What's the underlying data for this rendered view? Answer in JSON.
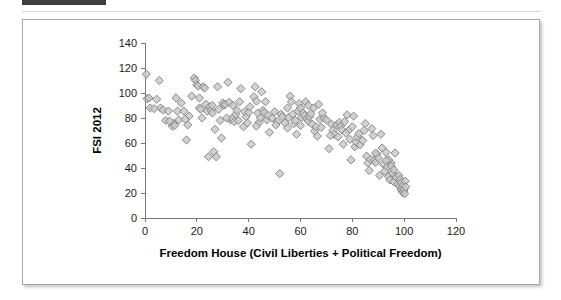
{
  "decor": {
    "top_bar_color": "#3d3d3d",
    "top_bar_track_color": "#e8e8e8",
    "rule_color": "#d6d6d6"
  },
  "figure": {
    "border_color": "#a8a8a8",
    "background_color": "#ffffff"
  },
  "chart_data": {
    "type": "scatter",
    "title": "",
    "subtitle": "",
    "xlabel": "Freedom House (Civil Liberties + Political Freedom)",
    "ylabel": "FSI 2012",
    "xlim": [
      0,
      120
    ],
    "ylim": [
      0,
      140
    ],
    "xticks": [
      0,
      20,
      40,
      60,
      80,
      100,
      120
    ],
    "yticks": [
      0,
      20,
      40,
      60,
      80,
      100,
      120,
      140
    ],
    "grid": false,
    "legend": null,
    "legend_position": "none",
    "marker": {
      "shape": "diamond",
      "size_px": 7,
      "fill": "#c9c9c9",
      "edge": "#7f7f7f"
    },
    "annotations": [],
    "series": [
      {
        "name": "Countries",
        "points": [
          [
            0.5,
            115.0
          ],
          [
            0.8,
            95.5
          ],
          [
            1.5,
            96.0
          ],
          [
            2.0,
            88.0
          ],
          [
            4.5,
            95.0
          ],
          [
            5.5,
            110.0
          ],
          [
            6.0,
            88.0
          ],
          [
            7.0,
            86.5
          ],
          [
            8.0,
            78.0
          ],
          [
            9.0,
            85.5
          ],
          [
            10.5,
            73.5
          ],
          [
            11.0,
            75.5
          ],
          [
            11.5,
            74.0
          ],
          [
            12.0,
            96.0
          ],
          [
            12.5,
            85.5
          ],
          [
            13.0,
            78.5
          ],
          [
            14.0,
            92.0
          ],
          [
            15.0,
            85.5
          ],
          [
            16.0,
            62.5
          ],
          [
            16.5,
            74.5
          ],
          [
            17.0,
            81.5
          ],
          [
            18.0,
            97.5
          ],
          [
            19.0,
            112.0
          ],
          [
            19.5,
            110.0
          ],
          [
            20.0,
            106.5
          ],
          [
            20.5,
            105.5
          ],
          [
            21.0,
            88.0
          ],
          [
            21.5,
            87.0
          ],
          [
            22.0,
            80.0
          ],
          [
            22.5,
            105.0
          ],
          [
            23.0,
            104.0
          ],
          [
            23.5,
            91.0
          ],
          [
            24.0,
            85.5
          ],
          [
            24.5,
            49.0
          ],
          [
            25.0,
            89.0
          ],
          [
            25.5,
            86.0
          ],
          [
            26.0,
            84.0
          ],
          [
            26.5,
            53.0
          ],
          [
            27.0,
            71.0
          ],
          [
            27.5,
            49.0
          ],
          [
            28.0,
            105.0
          ],
          [
            28.5,
            87.0
          ],
          [
            29.0,
            78.0
          ],
          [
            29.5,
            64.0
          ],
          [
            30.0,
            92.0
          ],
          [
            30.5,
            90.5
          ],
          [
            31.0,
            91.0
          ],
          [
            32.0,
            108.5
          ],
          [
            32.5,
            92.5
          ],
          [
            33.0,
            78.5
          ],
          [
            33.5,
            79.5
          ],
          [
            34.0,
            90.0
          ],
          [
            34.5,
            77.0
          ],
          [
            35.0,
            83.0
          ],
          [
            35.5,
            86.0
          ],
          [
            36.0,
            78.0
          ],
          [
            37.0,
            103.5
          ],
          [
            38.0,
            73.0
          ],
          [
            38.5,
            85.0
          ],
          [
            39.0,
            81.0
          ],
          [
            40.0,
            84.5
          ],
          [
            40.5,
            89.0
          ],
          [
            41.0,
            59.0
          ],
          [
            42.0,
            97.0
          ],
          [
            42.5,
            105.0
          ],
          [
            43.0,
            93.5
          ],
          [
            43.5,
            84.0
          ],
          [
            44.0,
            76.5
          ],
          [
            44.5,
            80.0
          ],
          [
            45.0,
            101.0
          ],
          [
            45.5,
            86.0
          ],
          [
            46.0,
            84.5
          ],
          [
            47.0,
            78.5
          ],
          [
            47.5,
            82.0
          ],
          [
            48.0,
            68.5
          ],
          [
            49.0,
            80.0
          ],
          [
            50.0,
            85.0
          ],
          [
            51.0,
            77.0
          ],
          [
            52.0,
            35.5
          ],
          [
            52.5,
            83.0
          ],
          [
            53.0,
            81.0
          ],
          [
            54.0,
            76.0
          ],
          [
            55.0,
            88.0
          ],
          [
            55.5,
            80.5
          ],
          [
            56.0,
            97.5
          ],
          [
            56.5,
            93.0
          ],
          [
            57.0,
            83.0
          ],
          [
            57.5,
            75.5
          ],
          [
            58.0,
            78.0
          ],
          [
            58.5,
            67.0
          ],
          [
            59.0,
            85.5
          ],
          [
            59.5,
            91.5
          ],
          [
            60.0,
            88.0
          ],
          [
            60.5,
            80.5
          ],
          [
            61.0,
            84.0
          ],
          [
            61.5,
            82.0
          ],
          [
            62.0,
            93.0
          ],
          [
            62.5,
            79.5
          ],
          [
            63.0,
            77.5
          ],
          [
            63.5,
            81.0
          ],
          [
            64.0,
            83.5
          ],
          [
            64.5,
            75.0
          ],
          [
            65.0,
            88.0
          ],
          [
            65.5,
            69.5
          ],
          [
            66.0,
            73.0
          ],
          [
            66.5,
            65.5
          ],
          [
            67.0,
            91.0
          ],
          [
            67.5,
            79.0
          ],
          [
            68.0,
            72.5
          ],
          [
            69.0,
            80.0
          ],
          [
            70.0,
            78.5
          ],
          [
            71.0,
            55.5
          ],
          [
            72.0,
            75.0
          ],
          [
            72.5,
            70.0
          ],
          [
            73.0,
            67.0
          ],
          [
            74.0,
            74.5
          ],
          [
            75.0,
            76.5
          ],
          [
            75.5,
            73.5
          ],
          [
            76.0,
            70.5
          ],
          [
            76.5,
            59.0
          ],
          [
            77.0,
            77.0
          ],
          [
            78.0,
            82.5
          ],
          [
            78.5,
            70.0
          ],
          [
            79.0,
            63.0
          ],
          [
            79.5,
            46.5
          ],
          [
            80.0,
            73.0
          ],
          [
            80.5,
            81.5
          ],
          [
            81.0,
            57.0
          ],
          [
            81.5,
            60.5
          ],
          [
            82.0,
            65.0
          ],
          [
            82.5,
            67.5
          ],
          [
            83.0,
            58.5
          ],
          [
            84.0,
            62.0
          ],
          [
            85.0,
            75.5
          ],
          [
            85.5,
            49.5
          ],
          [
            86.0,
            44.0
          ],
          [
            86.5,
            38.0
          ],
          [
            87.0,
            47.0
          ],
          [
            87.5,
            71.5
          ],
          [
            88.0,
            66.0
          ],
          [
            88.5,
            46.5
          ],
          [
            89.0,
            44.5
          ],
          [
            89.5,
            51.0
          ],
          [
            90.0,
            48.0
          ],
          [
            90.5,
            34.0
          ],
          [
            91.0,
            67.0
          ],
          [
            91.5,
            56.0
          ],
          [
            92.0,
            43.0
          ],
          [
            92.5,
            37.5
          ],
          [
            93.0,
            52.5
          ],
          [
            93.5,
            41.0
          ],
          [
            94.0,
            33.0
          ],
          [
            94.5,
            30.5
          ],
          [
            95.0,
            44.0
          ],
          [
            95.5,
            36.0
          ],
          [
            96.0,
            29.0
          ],
          [
            96.5,
            52.0
          ],
          [
            97.0,
            32.5
          ],
          [
            97.5,
            27.0
          ],
          [
            98.0,
            34.0
          ],
          [
            98.2,
            25.5
          ],
          [
            98.5,
            31.0
          ],
          [
            98.8,
            22.5
          ],
          [
            99.0,
            28.5
          ],
          [
            99.2,
            24.0
          ],
          [
            99.4,
            20.5
          ],
          [
            99.6,
            26.0
          ],
          [
            99.8,
            21.5
          ],
          [
            100.0,
            23.0
          ],
          [
            100.2,
            19.5
          ],
          [
            100.4,
            29.5
          ],
          [
            100.6,
            25.0
          ],
          [
            94.0,
            46.5
          ],
          [
            95.0,
            41.5
          ],
          [
            96.0,
            38.5
          ],
          [
            93.0,
            46.0
          ],
          [
            89.0,
            52.0
          ],
          [
            84.5,
            70.0
          ],
          [
            77.5,
            68.0
          ],
          [
            74.5,
            65.0
          ],
          [
            71.5,
            66.0
          ],
          [
            68.5,
            84.0
          ],
          [
            63.0,
            90.0
          ],
          [
            60.0,
            74.0
          ],
          [
            55.0,
            72.0
          ],
          [
            50.5,
            74.5
          ],
          [
            46.5,
            93.0
          ],
          [
            43.0,
            73.5
          ],
          [
            39.5,
            76.0
          ],
          [
            36.5,
            93.0
          ],
          [
            31.5,
            80.0
          ],
          [
            26.0,
            90.0
          ],
          [
            21.0,
            96.0
          ],
          [
            15.5,
            79.0
          ],
          [
            9.5,
            77.5
          ],
          [
            3.5,
            87.5
          ]
        ]
      }
    ]
  }
}
